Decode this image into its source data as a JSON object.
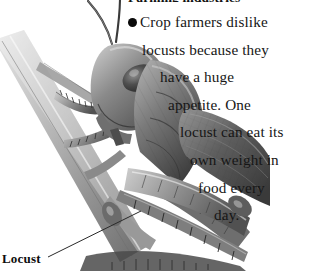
{
  "page": {
    "background_color": "#ffffff",
    "width": 335,
    "height": 271
  },
  "heading": {
    "text": "Farming industries",
    "note": "clipped at top edge of screenshot, only descenders visible"
  },
  "body": {
    "bullet_glyph": "●",
    "lines": [
      {
        "indent": 0,
        "text": "Crop farmers dislike",
        "has_bullet": true
      },
      {
        "indent": 1,
        "text": "locusts because they",
        "has_bullet": false
      },
      {
        "indent": 2,
        "text": "have a huge",
        "has_bullet": false
      },
      {
        "indent": 3,
        "text": "appetite. One",
        "has_bullet": false
      },
      {
        "indent": 4,
        "text": "locust can eat its",
        "has_bullet": false
      },
      {
        "indent": 5,
        "text": "own weight in",
        "has_bullet": false
      },
      {
        "indent": 6,
        "text": "food every",
        "has_bullet": false
      },
      {
        "indent": 7,
        "text": "day.",
        "has_bullet": false
      }
    ],
    "full_text": "Crop farmers dislike locusts because they have a huge appetite. One locust can eat its own weight in food every day.",
    "text_color": "#161616"
  },
  "caption": {
    "label": "Locust",
    "color": "#0d0d0d"
  },
  "illustration": {
    "subject": "locust-on-stem",
    "style": "grayscale engraving",
    "parts": [
      "antenna-left",
      "antenna-right",
      "head",
      "compound-eye",
      "pronotum",
      "thorax",
      "forewing",
      "hind-leg-femur",
      "hind-leg-tibia",
      "front-legs",
      "plant-stem",
      "plant-stem-lower"
    ],
    "tones": {
      "darkest": "#2b2b2b",
      "dark": "#4a4a4a",
      "mid": "#787878",
      "light": "#a8a8a8",
      "lightest": "#d9d9d9"
    }
  },
  "leader_line": {
    "from_x": 48,
    "from_y": 257,
    "to_x": 141,
    "to_y": 211,
    "color": "#2a2a2a"
  }
}
